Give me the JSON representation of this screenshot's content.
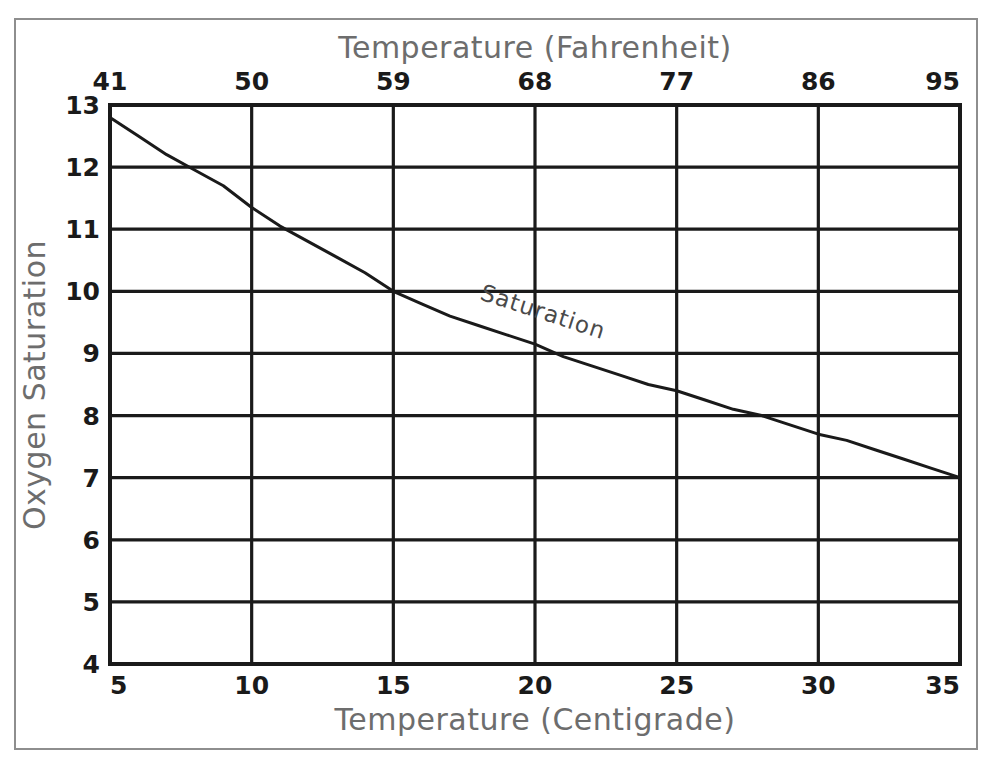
{
  "figure": {
    "background_color": "#ffffff",
    "frame_color": "#8e8e8e",
    "axis_color": "#1a1a1a",
    "label_color": "#6d6d6d",
    "curve_color": "#1a1a1a"
  },
  "chart_data": {
    "type": "line",
    "title": "",
    "xlabel": "Temperature (Centigrade)",
    "ylabel": "Oxygen Saturation",
    "x2label": "Temperature (Fahrenheit)",
    "xlim": [
      5,
      35
    ],
    "ylim": [
      4,
      13
    ],
    "x2lim": [
      41,
      95
    ],
    "grid": true,
    "legend": "none",
    "xticks": [
      5,
      10,
      15,
      20,
      25,
      30,
      35
    ],
    "xticklabels": [
      "5",
      "10",
      "15",
      "20",
      "25",
      "30",
      "35"
    ],
    "yticks": [
      4,
      5,
      6,
      7,
      8,
      9,
      10,
      11,
      12,
      13
    ],
    "yticklabels": [
      "4",
      "5",
      "6",
      "7",
      "8",
      "9",
      "10",
      "11",
      "12",
      "13"
    ],
    "x2ticks": [
      41,
      50,
      59,
      68,
      77,
      86,
      95
    ],
    "x2ticklabels": [
      "41",
      "50",
      "59",
      "68",
      "77",
      "86",
      "95"
    ],
    "series": [
      {
        "name": "Saturation",
        "annotation": "Saturation",
        "annotation_x": 20.2,
        "annotation_y": 9.55,
        "annotation_rotation": 18,
        "x": [
          5,
          6,
          7,
          8,
          9,
          10,
          11,
          12,
          13,
          14,
          15,
          16,
          17,
          18,
          19,
          20,
          21,
          22,
          23,
          24,
          25,
          26,
          27,
          28,
          29,
          30,
          31,
          32,
          33,
          34,
          35
        ],
        "values": [
          12.8,
          12.5,
          12.2,
          11.95,
          11.7,
          11.35,
          11.05,
          10.8,
          10.55,
          10.3,
          10.0,
          9.8,
          9.6,
          9.45,
          9.3,
          9.15,
          8.95,
          8.8,
          8.65,
          8.5,
          8.4,
          8.25,
          8.1,
          8.0,
          7.85,
          7.7,
          7.6,
          7.45,
          7.3,
          7.15,
          7.0
        ]
      }
    ]
  }
}
